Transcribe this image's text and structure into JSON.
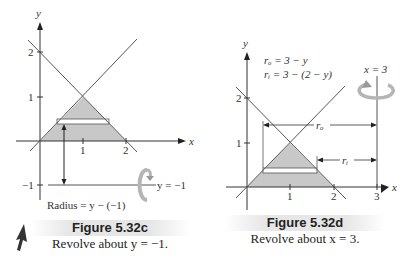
{
  "figures": [
    {
      "id": "left",
      "title": "Figure 5.32c",
      "subtitle": "Revolve about y = −1.",
      "axis_x_label": "x",
      "axis_y_label": "y",
      "x_ticks": [
        "1",
        "2"
      ],
      "y_ticks": [
        "2",
        "1",
        "−1"
      ],
      "axis_line_label": "y = −1",
      "radius_label": "Radius = y − (−1)",
      "rotation_icon": "rotate-arrow-icon"
    },
    {
      "id": "right",
      "title": "Figure 5.32d",
      "subtitle": "Revolve about x = 3.",
      "axis_x_label": "x",
      "axis_y_label": "y",
      "x_ticks": [
        "1",
        "2",
        "3"
      ],
      "y_ticks": [
        "2",
        "1"
      ],
      "axis_line_label": "x = 3",
      "r_outer_eq": "rₒ = 3 − y",
      "r_inner_eq": "rᵢ = 3 − (2 − y)",
      "r_outer_label": "rₒ",
      "r_inner_label": "rᵢ",
      "rotation_icon": "rotate-arrow-icon"
    }
  ],
  "colors": {
    "shade": "#c8c8c8",
    "line": "#555555",
    "rotate_arrow": "#b5b5b5"
  }
}
